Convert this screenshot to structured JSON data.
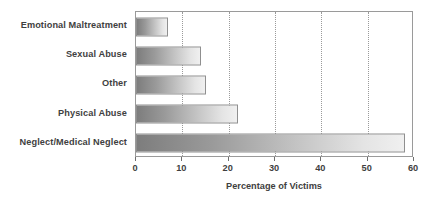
{
  "chart_data": {
    "type": "bar",
    "orientation": "horizontal",
    "title": "",
    "xlabel": "Percentage of Victims",
    "ylabel": "",
    "xlim": [
      0,
      60
    ],
    "xticks": [
      0,
      10,
      20,
      30,
      40,
      50,
      60
    ],
    "xtick_labels": [
      "0",
      "10",
      "20",
      "30",
      "40",
      "50",
      "60"
    ],
    "grid": "vertical-dotted",
    "legend": "none",
    "categories": [
      "Emotional Maltreatment",
      "Sexual Abuse",
      "Other",
      "Physical Abuse",
      "Neglect/Medical Neglect"
    ],
    "values": [
      7,
      14,
      15,
      22,
      58
    ],
    "bar_gradient": {
      "from": "#7d7d7d",
      "to": "#f0f0f0",
      "border": "#8f8f8f"
    },
    "axis_color": "#9a9a9a",
    "text_color": "#3f3f3f",
    "background": "#ffffff"
  }
}
